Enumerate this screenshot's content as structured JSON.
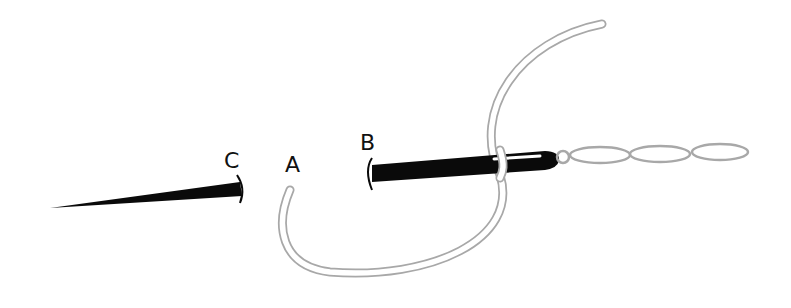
{
  "diagram": {
    "labels": {
      "a": "A",
      "b": "B",
      "c": "C"
    },
    "colors": {
      "needle": "#0a0a0a",
      "thread": "#a8a8a8",
      "background": "#ffffff"
    },
    "elements": [
      "needle-point-entering-at-C",
      "needle-body-exiting-at-B",
      "thread-loop-from-A",
      "chain-stitches"
    ],
    "chain_stitch_count": 3
  }
}
